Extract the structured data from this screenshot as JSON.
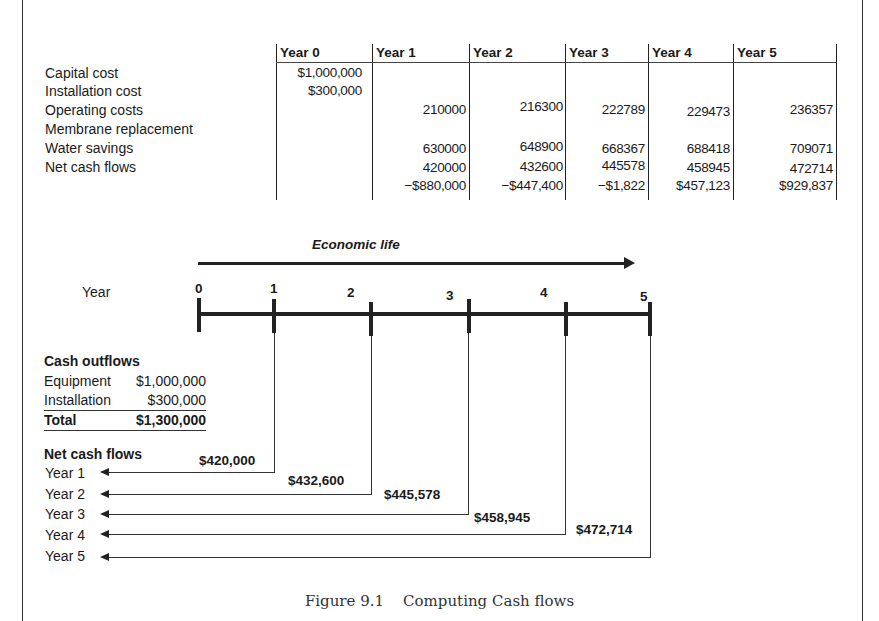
{
  "table": {
    "headers": [
      "Year 0",
      "Year 1",
      "Year 2",
      "Year 3",
      "Year 4",
      "Year 5"
    ],
    "rows": [
      {
        "label": "Capital cost",
        "values": [
          "$1,000,000",
          "",
          "",
          "",
          "",
          ""
        ]
      },
      {
        "label": "Installation cost",
        "values": [
          "$300,000",
          "",
          "",
          "",
          "",
          ""
        ]
      },
      {
        "label": "Operating costs",
        "values": [
          "",
          "210000",
          "216300",
          "222789",
          "229473",
          "236357"
        ]
      },
      {
        "label": "Membrane replacement",
        "values": [
          "",
          "",
          "",
          "",
          "",
          ""
        ]
      },
      {
        "label": "Water savings",
        "values": [
          "",
          "630000",
          "648900",
          "668367",
          "688418",
          "709071"
        ]
      },
      {
        "label": "Net cash flows",
        "values": [
          "",
          "420000",
          "432600",
          "445578",
          "458945",
          "472714"
        ]
      },
      {
        "label": "",
        "values": [
          "",
          "−$880,000",
          "−$447,400",
          "−$1,822",
          "$457,123",
          "$929,837"
        ]
      }
    ]
  },
  "timeline": {
    "economic_life_label": "Economic life",
    "year_label": "Year",
    "ticks": [
      "0",
      "1",
      "2",
      "3",
      "4",
      "5"
    ]
  },
  "cash_outflows": {
    "title": "Cash outflows",
    "items": [
      {
        "label": "Equipment",
        "value": "$1,000,000"
      },
      {
        "label": "Installation",
        "value": "$300,000"
      }
    ],
    "total": {
      "label": "Total",
      "value": "$1,300,000"
    }
  },
  "net_cash_flows": {
    "title": "Net cash flows",
    "years": [
      "Year 1",
      "Year 2",
      "Year 3",
      "Year 4",
      "Year 5"
    ],
    "amounts": [
      "$420,000",
      "$432,600",
      "$445,578",
      "$458,945",
      "$472,714"
    ]
  },
  "caption": "Figure 9.1    Computing Cash flows"
}
